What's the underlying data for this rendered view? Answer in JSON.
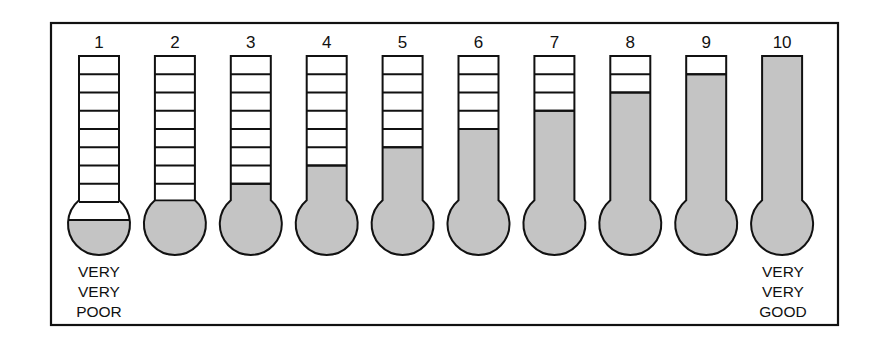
{
  "scale": {
    "title": "Thermometer rating scale",
    "fill_color": "#c4c4c4",
    "outline_color": "#111111",
    "segments_per_tube": 8,
    "thermometers": [
      {
        "label": "1",
        "filled_segments": 0,
        "bulb_fill": "half"
      },
      {
        "label": "2",
        "filled_segments": 0,
        "bulb_fill": "full"
      },
      {
        "label": "3",
        "filled_segments": 1,
        "bulb_fill": "full"
      },
      {
        "label": "4",
        "filled_segments": 2,
        "bulb_fill": "full"
      },
      {
        "label": "5",
        "filled_segments": 3,
        "bulb_fill": "full"
      },
      {
        "label": "6",
        "filled_segments": 4,
        "bulb_fill": "full"
      },
      {
        "label": "7",
        "filled_segments": 5,
        "bulb_fill": "full"
      },
      {
        "label": "8",
        "filled_segments": 6,
        "bulb_fill": "full"
      },
      {
        "label": "9",
        "filled_segments": 7,
        "bulb_fill": "full"
      },
      {
        "label": "10",
        "filled_segments": 8,
        "bulb_fill": "full"
      }
    ],
    "low_anchor": {
      "lines": [
        "VERY",
        "VERY",
        "POOR"
      ]
    },
    "high_anchor": {
      "lines": [
        "VERY",
        "VERY",
        "GOOD"
      ]
    }
  }
}
